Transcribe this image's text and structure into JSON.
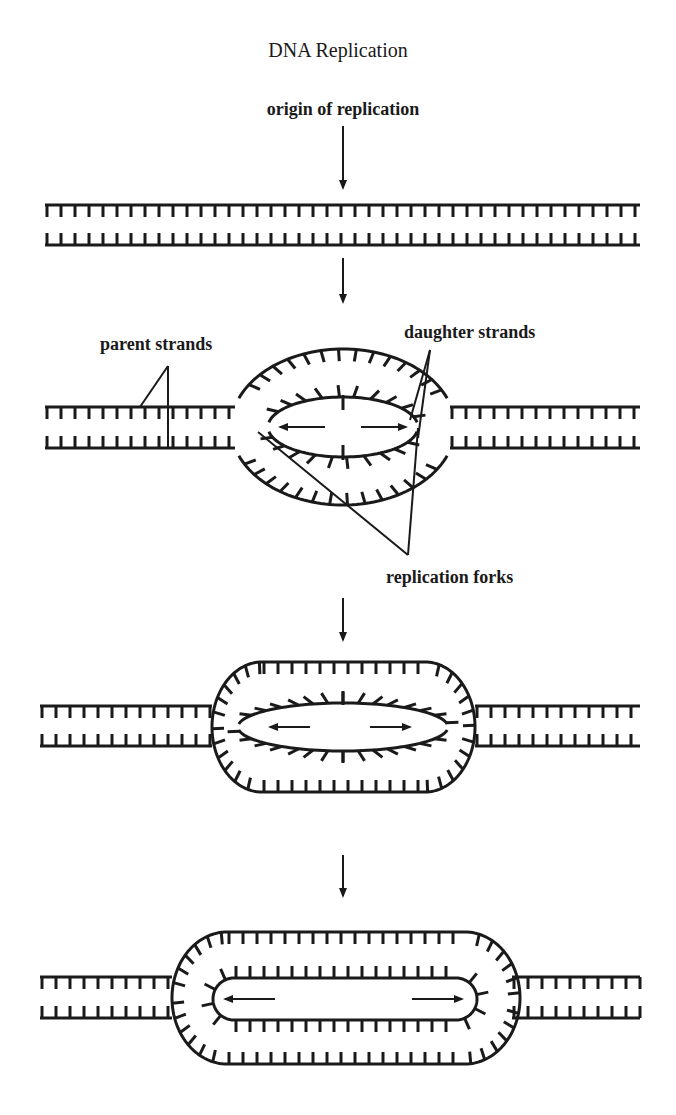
{
  "title": "DNA Replication",
  "labels": {
    "origin": "origin of replication",
    "parent": "parent strands",
    "daughter": "daughter strands",
    "forks": "replication forks"
  },
  "stages": [
    {
      "name": "unreplicated-dna"
    },
    {
      "name": "replication-bubble-small"
    },
    {
      "name": "replication-bubble-medium"
    },
    {
      "name": "replication-bubble-large"
    }
  ],
  "colors": {
    "ink": "#1a1a1a",
    "background": "#ffffff"
  }
}
